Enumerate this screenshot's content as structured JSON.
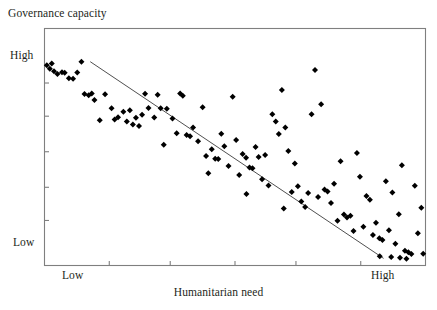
{
  "figure": {
    "width": 437,
    "height": 310,
    "background": "#ffffff"
  },
  "axis_titles": {
    "y": "Governance capacity",
    "x": "Humanitarian need"
  },
  "tick_labels": {
    "y_high": "High",
    "y_low": "Low",
    "x_low": "Low",
    "x_high": "High"
  },
  "colors": {
    "frame": "#7f7f7f",
    "marker": "#000000",
    "trendline": "#3b3b3b",
    "text": "#231f20"
  },
  "chart_data": {
    "type": "scatter",
    "title": "",
    "xlabel": "Humanitarian need",
    "ylabel": "Governance capacity",
    "xlim": [
      0,
      100
    ],
    "ylim": [
      0,
      100
    ],
    "grid": false,
    "legend": null,
    "x_tick_labels": [
      "Low",
      "High"
    ],
    "x_tick_values": [
      9,
      96
    ],
    "y_tick_labels": [
      "High",
      "Low"
    ],
    "y_tick_values": [
      88,
      9
    ],
    "x_minor_ticks": [
      17,
      33,
      50,
      66,
      83
    ],
    "y_minor_ticks": [
      77,
      63,
      48,
      33,
      19
    ],
    "trendline": {
      "type": "linear",
      "x": [
        12,
        89
      ],
      "y": [
        86,
        3
      ]
    },
    "points": [
      [
        0.6,
        84.5
      ],
      [
        1.4,
        83.0
      ],
      [
        1.9,
        85.2
      ],
      [
        3.4,
        80.8
      ],
      [
        4.6,
        81.5
      ],
      [
        5.3,
        81.3
      ],
      [
        6.4,
        79.0
      ],
      [
        8.6,
        81.4
      ],
      [
        9.7,
        86.0
      ],
      [
        10.5,
        72.4
      ],
      [
        12.4,
        72.6
      ],
      [
        13.1,
        69.8
      ],
      [
        15.9,
        72.3
      ],
      [
        17.6,
        66.4
      ],
      [
        19.3,
        62.6
      ],
      [
        20.7,
        64.9
      ],
      [
        21.6,
        60.8
      ],
      [
        22.4,
        65.5
      ],
      [
        23.2,
        59.5
      ],
      [
        24.0,
        62.3
      ],
      [
        24.8,
        58.9
      ],
      [
        25.6,
        63.6
      ],
      [
        26.4,
        72.5
      ],
      [
        27.3,
        66.5
      ],
      [
        28.8,
        62.5
      ],
      [
        29.7,
        72.0
      ],
      [
        30.5,
        66.3
      ],
      [
        32.1,
        66.1
      ],
      [
        33.6,
        62.0
      ],
      [
        34.7,
        55.8
      ],
      [
        35.6,
        72.6
      ],
      [
        36.3,
        71.6
      ],
      [
        37.3,
        55.1
      ],
      [
        38.2,
        54.5
      ],
      [
        39.0,
        58.2
      ],
      [
        40.3,
        52.4
      ],
      [
        41.5,
        66.8
      ],
      [
        42.4,
        46.2
      ],
      [
        43.9,
        49.1
      ],
      [
        44.8,
        45.0
      ],
      [
        45.6,
        44.9
      ],
      [
        46.4,
        55.6
      ],
      [
        47.2,
        50.3
      ],
      [
        48.3,
        42.0
      ],
      [
        49.4,
        71.2
      ],
      [
        50.3,
        53.0
      ],
      [
        51.1,
        38.2
      ],
      [
        52.0,
        47.0
      ],
      [
        52.9,
        45.5
      ],
      [
        53.8,
        41.3
      ],
      [
        54.6,
        41.0
      ],
      [
        55.4,
        50.0
      ],
      [
        56.2,
        45.8
      ],
      [
        57.1,
        36.4
      ],
      [
        57.9,
        46.6
      ],
      [
        58.8,
        33.8
      ],
      [
        59.8,
        63.8
      ],
      [
        60.7,
        60.8
      ],
      [
        61.5,
        55.5
      ],
      [
        62.3,
        74.0
      ],
      [
        63.2,
        58.2
      ],
      [
        64.0,
        48.3
      ],
      [
        64.9,
        31.0
      ],
      [
        65.7,
        43.0
      ],
      [
        66.5,
        33.4
      ],
      [
        67.4,
        27.0
      ],
      [
        68.4,
        24.7
      ],
      [
        69.2,
        30.6
      ],
      [
        70.1,
        63.8
      ],
      [
        71.0,
        82.5
      ],
      [
        71.8,
        28.9
      ],
      [
        72.6,
        68.0
      ],
      [
        73.5,
        32.1
      ],
      [
        74.3,
        31.2
      ],
      [
        75.2,
        26.4
      ],
      [
        76.0,
        34.5
      ],
      [
        76.9,
        18.9
      ],
      [
        77.7,
        44.0
      ],
      [
        78.6,
        21.5
      ],
      [
        79.4,
        20.3
      ],
      [
        80.3,
        21.0
      ],
      [
        81.1,
        14.6
      ],
      [
        82.0,
        47.5
      ],
      [
        82.8,
        37.5
      ],
      [
        83.7,
        16.4
      ],
      [
        84.5,
        29.3
      ],
      [
        85.4,
        27.7
      ],
      [
        86.2,
        12.9
      ],
      [
        87.0,
        18.0
      ],
      [
        87.9,
        11.5
      ],
      [
        88.7,
        10.8
      ],
      [
        89.6,
        35.6
      ],
      [
        90.4,
        14.9
      ],
      [
        91.3,
        30.8
      ],
      [
        92.1,
        9.2
      ],
      [
        93.0,
        21.6
      ],
      [
        93.8,
        42.3
      ],
      [
        94.6,
        6.2
      ],
      [
        95.5,
        5.6
      ],
      [
        96.3,
        4.8
      ],
      [
        97.2,
        33.7
      ],
      [
        98.0,
        13.6
      ],
      [
        98.9,
        24.4
      ],
      [
        99.4,
        5.0
      ],
      [
        2.5,
        82.0
      ],
      [
        7.5,
        78.8
      ],
      [
        11.6,
        71.8
      ],
      [
        14.5,
        61.3
      ],
      [
        18.4,
        61.6
      ],
      [
        31.3,
        51.0
      ],
      [
        43.0,
        38.9
      ],
      [
        53.0,
        30.2
      ],
      [
        62.8,
        24.0
      ],
      [
        88.0,
        3.9
      ],
      [
        91.0,
        3.6
      ],
      [
        93.3,
        3.3
      ],
      [
        95.0,
        2.9
      ]
    ]
  }
}
